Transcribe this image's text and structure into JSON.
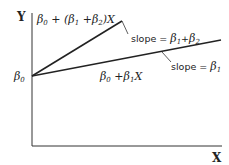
{
  "diagram": {
    "axes": {
      "y_label": "Y",
      "x_label": "X"
    },
    "intercept": {
      "symbol": "β",
      "subscript": "0"
    },
    "lines": [
      {
        "id": "steep",
        "equation": {
          "b0": "β",
          "b0_sub": "0",
          "plus1": " + (",
          "b1": "β",
          "b1_sub": "1",
          "plus2": " +",
          "b2": "β",
          "b2_sub": "2",
          "tail": ")X"
        },
        "slope_label": {
          "prefix": "slope = ",
          "b1": "β",
          "b1_sub": "1",
          "plus": "+",
          "b2": "β",
          "b2_sub": "2"
        }
      },
      {
        "id": "shallow",
        "equation": {
          "b0": "β",
          "b0_sub": "0",
          "plus": " +",
          "b1": "β",
          "b1_sub": "1",
          "tail": "X"
        },
        "slope_label": {
          "prefix": "slope = ",
          "b1": "β",
          "b1_sub": "1"
        }
      }
    ]
  }
}
